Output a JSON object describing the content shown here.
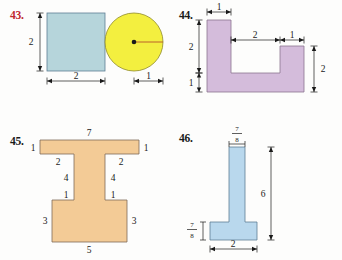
{
  "page": {
    "background_color": "#fdfdfc",
    "text_color": "#1a1a1a"
  },
  "problems": [
    {
      "number": "43.",
      "number_color": "#c0282f",
      "shapes": [
        {
          "name": "square",
          "fill": "#b6d5db",
          "stroke": "#5e7d94",
          "labels": {
            "height": "2",
            "width": "2"
          }
        },
        {
          "name": "circle",
          "fill": "#f3ef3f",
          "stroke": "#8f8a2a",
          "labels": {
            "radius": "1"
          }
        }
      ]
    },
    {
      "number": "44.",
      "number_color": "#1a1a1a",
      "shapes": [
        {
          "name": "u-shape",
          "fill": "#d4bcdb",
          "stroke": "#8a7390",
          "labels": {
            "left_arm_width": "1",
            "left_height": "2",
            "left_bottom": "1",
            "notch_width": "2",
            "right_arm_width": "1",
            "right_height": "2"
          }
        }
      ]
    },
    {
      "number": "45.",
      "number_color": "#1a1a1a",
      "shapes": [
        {
          "name": "i-beam-shape",
          "fill": "#f3cb96",
          "stroke": "#9c7f5c",
          "labels": {
            "top_width": "7",
            "top_left_height": "1",
            "top_right_height": "1",
            "shoulder_left": "2",
            "shoulder_right": "2",
            "stem_left": "4",
            "stem_right": "4",
            "lower_shoulder_left": "1",
            "lower_shoulder_right": "1",
            "base_left_height": "3",
            "base_right_height": "3",
            "base_width": "5"
          }
        }
      ]
    },
    {
      "number": "46.",
      "number_color": "#1a1a1a",
      "shapes": [
        {
          "name": "t-shape",
          "fill": "#b9d8ed",
          "stroke": "#5e7d94",
          "labels": {
            "top_width_numerator": "7",
            "top_width_denominator": "8",
            "total_height": "6",
            "foot_height_numerator": "7",
            "foot_height_denominator": "8",
            "foot_width": "2"
          }
        }
      ]
    }
  ]
}
